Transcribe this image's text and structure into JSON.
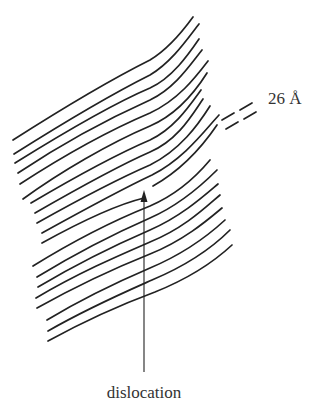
{
  "figure": {
    "type": "schematic",
    "line_color": "#222222",
    "text_color": "#333333",
    "background": "#ffffff"
  },
  "labels": {
    "spacing": "26 Å",
    "dislocation": "dislocation"
  },
  "layers": [
    {
      "d": "M13,140 C60,110 110,80 150,60 C170,48 185,28 193,17"
    },
    {
      "d": "M14,154 C60,125 110,95 150,75 C172,62 188,38 199,24"
    },
    {
      "d": "M15,163 C60,135 110,105 150,88 C172,78 188,55 199,39"
    },
    {
      "d": "M18,173 C60,145 110,118 150,100 C175,88 190,65 202,50"
    },
    {
      "d": "M20,184 C60,158 110,130 150,113 C178,100 195,78 208,61"
    },
    {
      "d": "M23,199 C60,172 110,143 150,126 C178,114 195,92 207,73"
    },
    {
      "d": "M31,203 C70,180 115,155 150,140 C175,128 190,105 201,90"
    },
    {
      "d": "M35,213 C75,190 118,166 150,152 C178,140 192,115 203,99"
    },
    {
      "d": "M37,223 C78,200 120,178 150,165 C180,150 198,125 210,106"
    },
    {
      "d": "M42,233 C80,212 120,190 152,175 C185,158 205,130 219,115"
    },
    {
      "d": "M42,243 C80,222 115,205 144,198"
    },
    {
      "d": "M153,186 C178,172 200,150 217,125"
    },
    {
      "d": "M33,266 C75,240 115,220 150,206 C180,193 200,172 210,160"
    },
    {
      "d": "M37,277 C78,252 118,232 150,218 C182,204 205,182 217,170"
    },
    {
      "d": "M38,287 C80,262 120,243 150,230 C182,216 205,195 218,184"
    },
    {
      "d": "M36,298 C80,272 120,255 150,242 C185,228 208,205 220,195"
    },
    {
      "d": "M37,308 C80,284 120,266 150,254 C185,240 210,218 222,208"
    },
    {
      "d": "M47,320 C85,297 122,280 150,268 C188,252 212,232 225,220"
    },
    {
      "d": "M48,331 C88,308 125,292 152,280 C190,264 215,245 230,230"
    },
    {
      "d": "M48,341 C90,318 128,302 155,292 C195,276 218,258 232,245"
    }
  ],
  "spacing_marker": {
    "dashes": [
      {
        "x1": 222,
        "y1": 120,
        "x2": 234,
        "y2": 113
      },
      {
        "x1": 240,
        "y1": 110,
        "x2": 252,
        "y2": 103
      },
      {
        "x1": 226,
        "y1": 129,
        "x2": 238,
        "y2": 122
      },
      {
        "x1": 244,
        "y1": 119,
        "x2": 256,
        "y2": 112
      }
    ],
    "label_x": 268,
    "label_y": 104
  },
  "arrow": {
    "x": 144,
    "y_tail": 372,
    "y_tip": 190,
    "label_x": 144,
    "label_y": 398
  }
}
